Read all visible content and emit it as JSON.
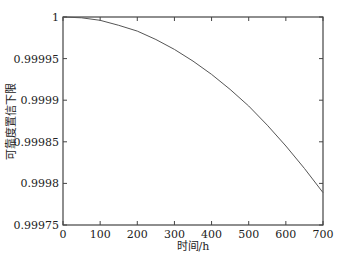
{
  "chart_data": {
    "type": "line",
    "title": "",
    "xlabel": "时间/h",
    "ylabel": "可靠度置信下限",
    "xlim": [
      0,
      700
    ],
    "ylim": [
      0.99975,
      1
    ],
    "x_ticks": [
      0,
      100,
      200,
      300,
      400,
      500,
      600,
      700
    ],
    "x_tick_labels": [
      "0",
      "100",
      "200",
      "300",
      "400",
      "500",
      "600",
      "700"
    ],
    "y_ticks": [
      0.99975,
      0.9998,
      0.99985,
      0.9999,
      0.99995,
      1
    ],
    "y_tick_labels": [
      "0.99975",
      "0.9998",
      "0.99985",
      "0.9999",
      "0.99995",
      "1"
    ],
    "grid": false,
    "legend": null,
    "series": [
      {
        "name": "可靠度置信下限",
        "color": "#555555",
        "x": [
          0,
          50,
          100,
          150,
          200,
          250,
          300,
          350,
          400,
          450,
          500,
          550,
          600,
          650,
          700
        ],
        "y": [
          1.0,
          0.999999,
          0.999996,
          0.99999,
          0.999983,
          0.999973,
          0.999961,
          0.999947,
          0.999931,
          0.999913,
          0.999893,
          0.99987,
          0.999845,
          0.999818,
          0.999789
        ]
      }
    ]
  }
}
